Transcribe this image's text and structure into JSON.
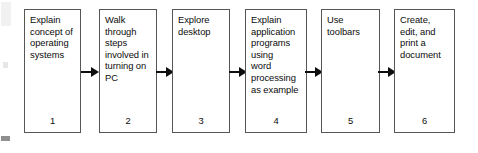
{
  "diagram": {
    "orientation": "left-to-right",
    "box_border_color": "#565656",
    "arrow_color": "#0e0e0e",
    "background_color": "#ffffff",
    "nodes": [
      {
        "number": "1",
        "text": "Explain\nconcept of\noperating\nsystems"
      },
      {
        "number": "2",
        "text": "Walk\nthrough\nsteps\ninvolved in\nturning on\nPC"
      },
      {
        "number": "3",
        "text": "Explore\ndesktop"
      },
      {
        "number": "4",
        "text": "Explain\napplication\nprograms\nusing\nword\nprocessing\nas example"
      },
      {
        "number": "5",
        "text": "Use\ntoolbars"
      },
      {
        "number": "6",
        "text": "Create,\nedit, and\nprint a\ndocument"
      }
    ],
    "connectors": [
      {
        "from": "1",
        "to": "2",
        "icon": "right-arrow-icon"
      },
      {
        "from": "2",
        "to": "3",
        "icon": "right-arrow-icon"
      },
      {
        "from": "3",
        "to": "4",
        "icon": "right-arrow-icon"
      },
      {
        "from": "4",
        "to": "5",
        "icon": "right-arrow-icon"
      },
      {
        "from": "5",
        "to": "6",
        "icon": "right-arrow-icon"
      }
    ]
  }
}
